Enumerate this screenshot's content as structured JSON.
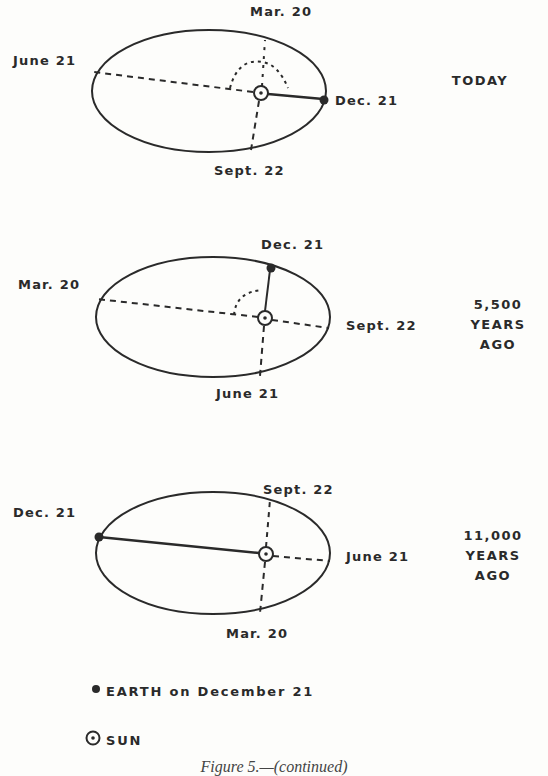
{
  "figure": {
    "caption": "Figure 5.—(continued)",
    "colors": {
      "ink": "#2a2a2a",
      "background": "#fdfdfb"
    }
  },
  "panels": [
    {
      "era": "TODAY",
      "labels": {
        "top": "Mar. 20",
        "left": "June 21",
        "right": "Dec. 21",
        "bottom": "Sept. 22"
      }
    },
    {
      "era": "5,500\nYEARS\nAGO",
      "labels": {
        "top": "Dec. 21",
        "left": "Mar. 20",
        "right": "Sept. 22",
        "bottom": "June 21"
      }
    },
    {
      "era": "11,000\nYEARS\nAGO",
      "labels": {
        "top": "Sept. 22",
        "left": "Dec. 21",
        "right": "June 21",
        "bottom": "Mar. 20"
      }
    }
  ],
  "legend": {
    "earth": "EARTH on December 21",
    "sun": "SUN"
  }
}
